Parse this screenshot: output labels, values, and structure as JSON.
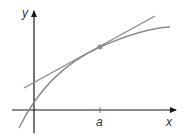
{
  "diagram": {
    "type": "tangent-line-to-curve",
    "axes": {
      "x_label": "x",
      "y_label": "y",
      "tick_label": "a"
    },
    "colors": {
      "axis": "#1a1a1a",
      "curve": "#8a8a8a",
      "tangent": "#8a8a8a",
      "point": "#8a8a8a",
      "background": "#ffffff"
    }
  }
}
